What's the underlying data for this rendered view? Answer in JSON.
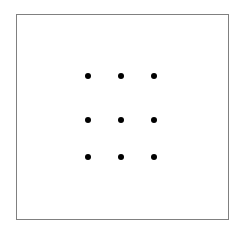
{
  "figure": {
    "background_color": "#ffffff",
    "canvas": {
      "width": 245,
      "height": 237
    }
  },
  "frame": {
    "name": "bounding-rectangle",
    "x": 16,
    "y": 14,
    "width": 213,
    "height": 206,
    "border_color": "#808080",
    "border_width": 1.5,
    "fill_color": "#ffffff"
  },
  "grid": {
    "rows": 3,
    "columns": 3,
    "count": 9,
    "dot_color": "#000000",
    "dot_diameter": 6,
    "column_centers_x": [
      88,
      121,
      154
    ],
    "row_centers_y": [
      76,
      120,
      157
    ],
    "column_spacing": 33,
    "row_spacing": 40.5,
    "dots": [
      {
        "name": "dot-r1-c1",
        "row": 1,
        "column": 1,
        "cx": 88,
        "cy": 76
      },
      {
        "name": "dot-r1-c2",
        "row": 1,
        "column": 2,
        "cx": 121,
        "cy": 76
      },
      {
        "name": "dot-r1-c3",
        "row": 1,
        "column": 3,
        "cx": 154,
        "cy": 76
      },
      {
        "name": "dot-r2-c1",
        "row": 2,
        "column": 1,
        "cx": 88,
        "cy": 120
      },
      {
        "name": "dot-r2-c2",
        "row": 2,
        "column": 2,
        "cx": 121,
        "cy": 120
      },
      {
        "name": "dot-r2-c3",
        "row": 2,
        "column": 3,
        "cx": 154,
        "cy": 120
      },
      {
        "name": "dot-r3-c1",
        "row": 3,
        "column": 1,
        "cx": 88,
        "cy": 157
      },
      {
        "name": "dot-r3-c2",
        "row": 3,
        "column": 2,
        "cx": 121,
        "cy": 157
      },
      {
        "name": "dot-r3-c3",
        "row": 3,
        "column": 3,
        "cx": 154,
        "cy": 157
      }
    ]
  }
}
